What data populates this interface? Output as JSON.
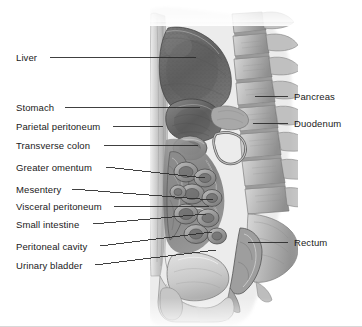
{
  "figure": {
    "background_color": "#ffffff",
    "label_color": "#1a1a1a",
    "leader_color": "#2b2b2b",
    "width": 362,
    "height": 327
  },
  "labels_left": [
    {
      "id": "liver",
      "text": "Liver",
      "x": 16,
      "y": 52,
      "text_end_x": 46,
      "leader_to_x": 196,
      "leader_to_y": 57,
      "anchor_y": 57
    },
    {
      "id": "stomach",
      "text": "Stomach",
      "x": 16,
      "y": 102,
      "text_end_x": 61,
      "leader_to_x": 200,
      "leader_to_y": 107,
      "anchor_y": 107
    },
    {
      "id": "parietal-peritoneum",
      "text": "Parietal peritoneum",
      "x": 16,
      "y": 121,
      "text_end_x": 109,
      "leader_to_x": 163,
      "leader_to_y": 126,
      "anchor_y": 126
    },
    {
      "id": "transverse-colon",
      "text": "Transverse colon",
      "x": 16,
      "y": 140,
      "text_end_x": 100,
      "leader_to_x": 198,
      "leader_to_y": 145,
      "anchor_y": 145
    },
    {
      "id": "greater-omentum",
      "text": "Greater omentum",
      "x": 16,
      "y": 162,
      "text_end_x": 102,
      "leader_to_x": 205,
      "leader_to_y": 178,
      "anchor_y": 167
    },
    {
      "id": "mesentery",
      "text": "Mesentery",
      "x": 16,
      "y": 184,
      "text_end_x": 68,
      "leader_to_x": 213,
      "leader_to_y": 200,
      "anchor_y": 189
    },
    {
      "id": "visceral-peritoneum",
      "text": "Visceral peritoneum",
      "x": 16,
      "y": 201,
      "text_end_x": 110,
      "leader_to_x": 209,
      "leader_to_y": 206,
      "anchor_y": 206
    },
    {
      "id": "small-intestine",
      "text": "Small intestine",
      "x": 16,
      "y": 219,
      "text_end_x": 89,
      "leader_to_x": 206,
      "leader_to_y": 214,
      "anchor_y": 224
    },
    {
      "id": "peritoneal-cavity",
      "text": "Peritoneal cavity",
      "x": 16,
      "y": 241,
      "text_end_x": 96,
      "leader_to_x": 212,
      "leader_to_y": 232,
      "anchor_y": 246
    },
    {
      "id": "urinary-bladder",
      "text": "Urinary bladder",
      "x": 16,
      "y": 260,
      "text_end_x": 91,
      "leader_to_x": 216,
      "leader_to_y": 250,
      "anchor_y": 265
    }
  ],
  "labels_right": [
    {
      "id": "pancreas",
      "text": "Pancreas",
      "x": 294,
      "y": 91,
      "leader_from_x": 255,
      "leader_from_y": 96,
      "leader_to_x": 288,
      "leader_to_y": 96
    },
    {
      "id": "duodenum",
      "text": "Duodenum",
      "x": 294,
      "y": 118,
      "leader_from_x": 253,
      "leader_from_y": 123,
      "leader_to_x": 288,
      "leader_to_y": 123
    },
    {
      "id": "rectum",
      "text": "Rectum",
      "x": 294,
      "y": 237,
      "leader_from_x": 248,
      "leader_from_y": 242,
      "leader_to_x": 288,
      "leader_to_y": 242
    }
  ],
  "structures": [
    {
      "id": "liver-mass",
      "name": "Liver"
    },
    {
      "id": "stomach-mass",
      "name": "Stomach"
    },
    {
      "id": "vertebral-column",
      "name": "Vertebral column"
    },
    {
      "id": "pancreas-region",
      "name": "Pancreas"
    },
    {
      "id": "duodenum-region",
      "name": "Duodenum"
    },
    {
      "id": "transverse-colon-region",
      "name": "Transverse colon"
    },
    {
      "id": "small-intestine-loops",
      "name": "Small intestine"
    },
    {
      "id": "greater-omentum-region",
      "name": "Greater omentum"
    },
    {
      "id": "urinary-bladder-region",
      "name": "Urinary bladder"
    },
    {
      "id": "rectum-region",
      "name": "Rectum"
    },
    {
      "id": "abdominal-wall",
      "name": "Anterior abdominal wall"
    }
  ]
}
